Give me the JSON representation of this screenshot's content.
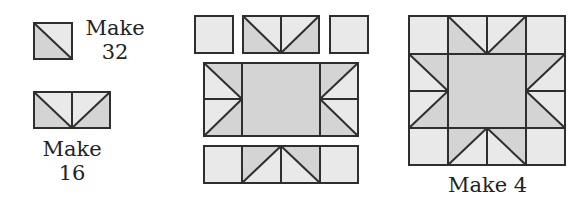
{
  "diagram": {
    "type": "quilt-block-assembly",
    "colors": {
      "light": "#e9e9e9",
      "shade": "#d4d4d4",
      "line": "#2e2e2e"
    },
    "units": [
      {
        "name": "half-square-triangle",
        "label_line1": "Make",
        "label_line2": "32"
      },
      {
        "name": "flying-geese",
        "label_line1": "Make",
        "label_line2": "16"
      }
    ],
    "assembly": {
      "rows": [
        "square + flying geese + square",
        "flying geese + center square + flying geese",
        "square + flying geese + square"
      ]
    },
    "finished_block": {
      "name": "sawtooth-star-block",
      "label": "Make 4"
    }
  }
}
